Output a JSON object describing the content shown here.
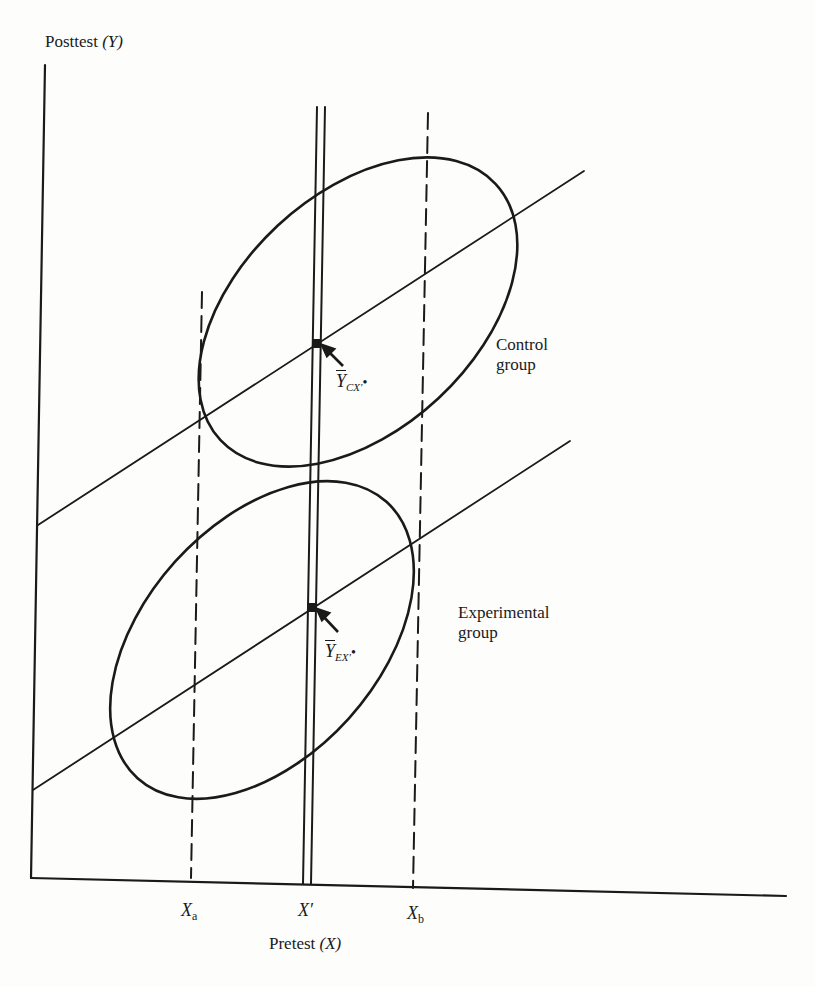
{
  "figure": {
    "y_axis_title": "Posttest",
    "y_axis_var": "(Y)",
    "x_axis_title": "Pretest",
    "x_axis_var": "(X)",
    "ticks": [
      {
        "main": "X",
        "sub": "a"
      },
      {
        "main": "X′",
        "sub": ""
      },
      {
        "main": "X",
        "sub": "b"
      }
    ],
    "groups": {
      "control": {
        "line1": "Control",
        "line2": "group",
        "mean_main": "Y",
        "mean_sub": "CX′",
        "mean_dot": "•"
      },
      "experimental": {
        "line1": "Experimental",
        "line2": "group",
        "mean_main": "Y",
        "mean_sub": "EX′",
        "mean_dot": "•"
      }
    },
    "colors": {
      "ink": "#1a1a1a",
      "paper": "#fdfdfc"
    }
  }
}
